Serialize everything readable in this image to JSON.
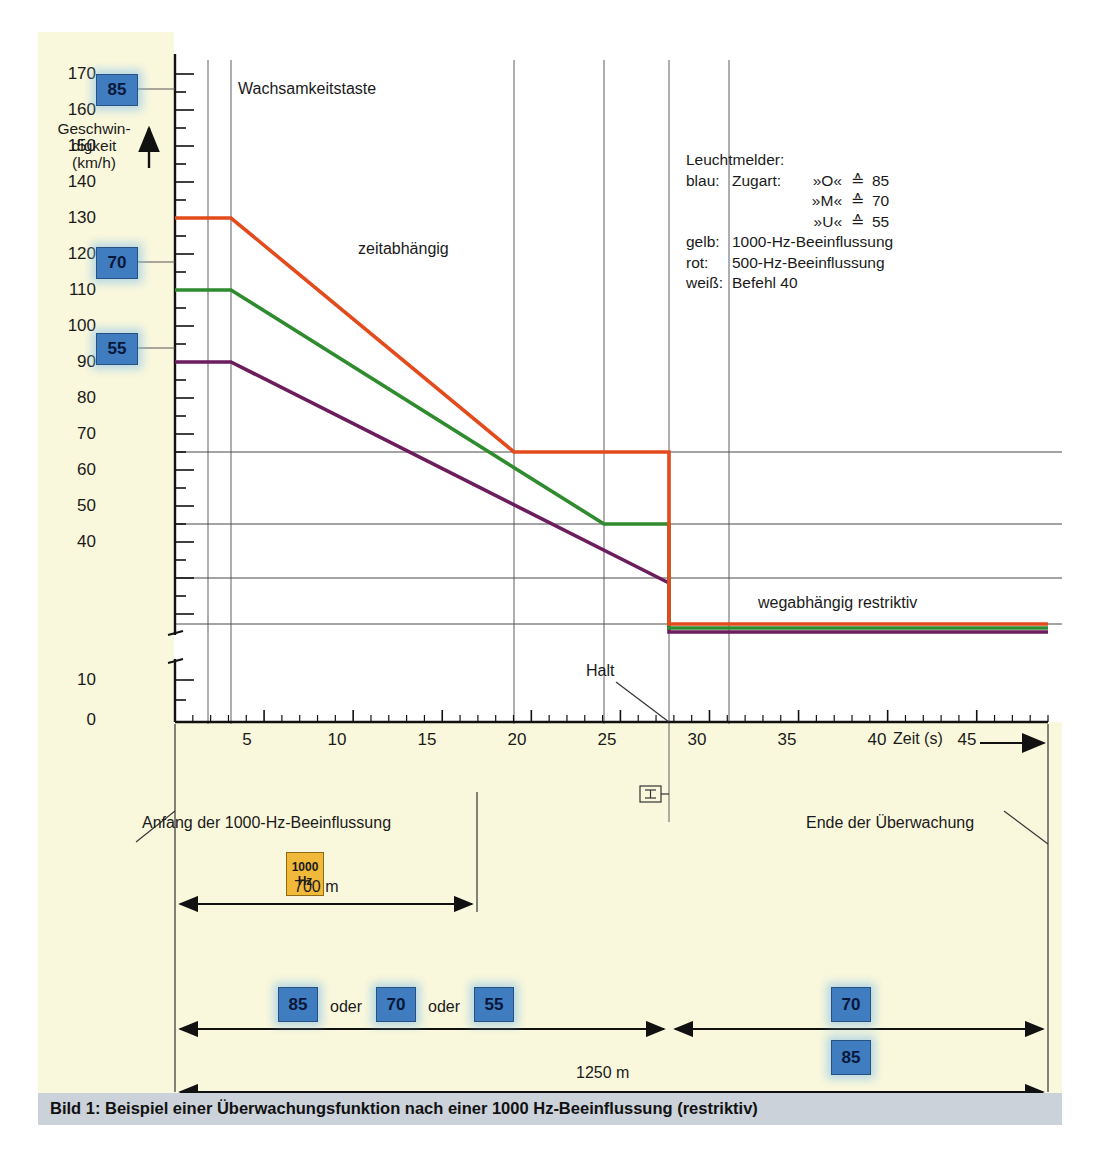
{
  "figure": {
    "caption": "Bild 1:  Beispiel einer Überwachungsfunktion nach einer 1000 Hz-Beeinflussung (restriktiv)",
    "bg_color": "#faf8dc",
    "plot_bg": "#ffffff",
    "caption_bar_color": "#ccd2da"
  },
  "axes": {
    "y_label_lines": [
      "Geschwin-",
      "digkeit",
      "(km/h)"
    ],
    "y_ticks": [
      170,
      160,
      150,
      140,
      130,
      120,
      110,
      100,
      90,
      80,
      70,
      60,
      50,
      40,
      10,
      0
    ],
    "y_break_between": [
      40,
      10
    ],
    "x_label": "Zeit (s)",
    "x_ticks": [
      5,
      10,
      15,
      20,
      25,
      30,
      35,
      40,
      45
    ],
    "x_minor_step": 1,
    "x_range": [
      0,
      49
    ],
    "y_range": [
      0,
      175
    ]
  },
  "annotations": {
    "wachsamkeitstaste": "Wachsamkeitstaste",
    "zeitabhaengig": "zeitabhängig",
    "wegabhaengig": "wegabhängig restriktiv",
    "halt": "Halt",
    "anfang": "Anfang der 1000-Hz-Beeinflussung",
    "ende": "Ende der Überwachung"
  },
  "legend": {
    "title": "Leuchtmelder:",
    "rows": [
      {
        "color_name": "blau:",
        "kind": "Zugart:",
        "sym": "»O«",
        "eq": "≙",
        "val": "85"
      },
      {
        "color_name": "",
        "kind": "",
        "sym": "»M«",
        "eq": "≙",
        "val": "70"
      },
      {
        "color_name": "",
        "kind": "",
        "sym": "»U«",
        "eq": "≙",
        "val": "55"
      }
    ],
    "lines": [
      {
        "color_name": "gelb:",
        "text": "1000-Hz-Beeinflussung"
      },
      {
        "color_name": "rot:",
        "text": "500-Hz-Beeinflussung"
      },
      {
        "color_name": "weiß:",
        "text": "Befehl 40"
      }
    ]
  },
  "badges": {
    "y_axis": [
      {
        "label": "85",
        "at_speed": 165
      },
      {
        "label": "70",
        "at_speed": 125
      },
      {
        "label": "55",
        "at_speed": 105
      }
    ],
    "hz": {
      "line1": "1000",
      "line2": "Hz",
      "color": "#f0b93a"
    },
    "train_types_left": [
      "85",
      "70",
      "55"
    ],
    "train_types_right": [
      "70",
      "85"
    ],
    "oder": "oder",
    "blue_color": "#3f7cc0"
  },
  "dimensions": [
    {
      "label": "700 m",
      "value": 700,
      "unit": "m"
    },
    {
      "label": "1250 m",
      "value": 1250,
      "unit": "m"
    }
  ],
  "chart_data": {
    "type": "line",
    "title": "Beispiel einer Überwachungsfunktion nach einer 1000 Hz-Beeinflussung (restriktiv)",
    "xlabel": "Zeit (s)",
    "ylabel": "Geschwindigkeit (km/h)",
    "xlim": [
      0,
      49
    ],
    "ylim": [
      0,
      175
    ],
    "grid": true,
    "legend_position": "upper-right",
    "yticks": [
      170,
      160,
      150,
      140,
      130,
      120,
      110,
      100,
      90,
      80,
      70,
      60,
      50,
      40,
      10,
      0
    ],
    "xticks": [
      5,
      10,
      15,
      20,
      25,
      30,
      35,
      40,
      45
    ],
    "hlines": [
      85,
      70,
      55,
      45
    ],
    "vlines": [
      2.2,
      3.6,
      23,
      29,
      34,
      38
    ],
    "series": [
      {
        "name": "Zugart O (85)",
        "color": "#e34b1c",
        "x": [
          0,
          2.2,
          23,
          34,
          34,
          49
        ],
        "y": [
          165,
          165,
          85,
          85,
          45,
          45
        ]
      },
      {
        "name": "Zugart M (70)",
        "color": "#2e8b2e",
        "x": [
          0,
          2.2,
          29,
          34,
          34,
          49
        ],
        "y": [
          125,
          125,
          70,
          70,
          45,
          45
        ]
      },
      {
        "name": "Zugart U (55)",
        "color": "#6b1d5e",
        "x": [
          0,
          2.2,
          34,
          34,
          49
        ],
        "y": [
          105,
          105,
          62,
          45,
          45
        ]
      }
    ],
    "annotations": [
      {
        "text": "Wachsamkeitstaste",
        "x": 4.5,
        "y": 166
      },
      {
        "text": "zeitabhängig",
        "x": 13.5,
        "y": 128
      },
      {
        "text": "wegabhängig restriktiv",
        "x": 38.5,
        "y": 52
      },
      {
        "text": "Halt",
        "x": 32,
        "y": 14
      }
    ]
  }
}
